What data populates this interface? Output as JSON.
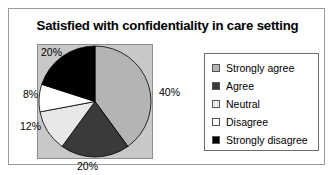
{
  "chart_data": {
    "type": "pie",
    "title": "Satisfied with confidentiality in care setting",
    "categories": [
      "Strongly agree",
      "Agree",
      "Neutral",
      "Disagree",
      "Strongly disagree"
    ],
    "values": [
      40,
      20,
      12,
      8,
      20
    ],
    "value_labels": [
      "40%",
      "20%",
      "12%",
      "8%",
      "20%"
    ],
    "unit": "percent",
    "total": 100,
    "start_angle_deg": 0,
    "direction": "clockwise",
    "legend_position": "right",
    "grid": false,
    "xlabel": "",
    "ylabel": "",
    "colors": [
      "#b4b4b4",
      "#3a3a3a",
      "#e8e8e8",
      "#ffffff",
      "#000000"
    ],
    "slices": [
      {
        "label": "Strongly agree",
        "value": 40,
        "display": "40%",
        "color": "#b4b4b4"
      },
      {
        "label": "Agree",
        "value": 20,
        "display": "20%",
        "color": "#3a3a3a"
      },
      {
        "label": "Neutral",
        "value": 12,
        "display": "12%",
        "color": "#e8e8e8"
      },
      {
        "label": "Disagree",
        "value": 8,
        "display": "8%",
        "color": "#ffffff"
      },
      {
        "label": "Strongly disagree",
        "value": 20,
        "display": "20%",
        "color": "#000000"
      }
    ]
  },
  "plot": {
    "background_color": "#c8c8c8",
    "border_color": "#8c8c8c"
  },
  "legend": {
    "items": [
      {
        "label": "Strongly agree",
        "color": "#b4b4b4"
      },
      {
        "label": "Agree",
        "color": "#3a3a3a"
      },
      {
        "label": "Neutral",
        "color": "#e8e8e8"
      },
      {
        "label": "Disagree",
        "color": "#ffffff"
      },
      {
        "label": "Strongly disagree",
        "color": "#000000"
      }
    ]
  }
}
